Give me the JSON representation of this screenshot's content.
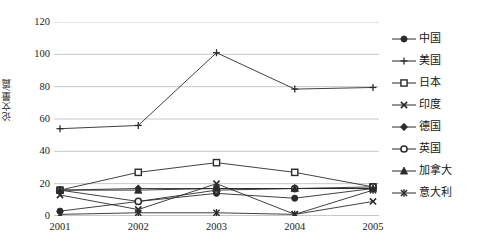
{
  "chart_data": {
    "type": "line",
    "title": "",
    "xlabel": "",
    "ylabel": "论文量/篇",
    "categories": [
      "2001",
      "2002",
      "2003",
      "2004",
      "2005"
    ],
    "x": [
      2001,
      2002,
      2003,
      2004,
      2005
    ],
    "ylim": [
      0,
      120
    ],
    "yticks": [
      0,
      20,
      40,
      60,
      80,
      100,
      120
    ],
    "grid": "horizontal",
    "legend_position": "right",
    "series": [
      {
        "name": "中国",
        "marker": "filled-circle",
        "values": [
          3,
          9,
          14,
          11,
          17
        ]
      },
      {
        "name": "美国",
        "marker": "plus",
        "values": [
          54,
          56,
          101,
          78.5,
          79.5
        ]
      },
      {
        "name": "日本",
        "marker": "open-square",
        "values": [
          16,
          27,
          33,
          27,
          18
        ]
      },
      {
        "name": "印度",
        "marker": "cross",
        "values": [
          13,
          4,
          20,
          1,
          9
        ]
      },
      {
        "name": "德国",
        "marker": "filled-diamond",
        "values": [
          16,
          17,
          17,
          17,
          17
        ]
      },
      {
        "name": "英国",
        "marker": "open-circle",
        "values": [
          16,
          9,
          16,
          17,
          18
        ]
      },
      {
        "name": "加拿大",
        "marker": "filled-triangle",
        "values": [
          16,
          16,
          17,
          17,
          17
        ]
      },
      {
        "name": "意大利",
        "marker": "asterisk",
        "values": [
          1,
          2,
          2,
          1,
          16
        ]
      }
    ]
  },
  "axis": {
    "y_tick_labels": [
      "120",
      "100",
      "80",
      "60",
      "40",
      "20",
      "0"
    ],
    "y_title": "论文量/篇",
    "x_tick_labels": [
      "2001",
      "2002",
      "2003",
      "2004",
      "2005"
    ]
  },
  "legend": {
    "items": [
      {
        "label": "中国",
        "icon": "filled-circle-marker-icon"
      },
      {
        "label": "美国",
        "icon": "plus-marker-icon"
      },
      {
        "label": "日本",
        "icon": "open-square-marker-icon"
      },
      {
        "label": "印度",
        "icon": "cross-marker-icon"
      },
      {
        "label": "德国",
        "icon": "filled-diamond-marker-icon"
      },
      {
        "label": "英国",
        "icon": "open-circle-marker-icon"
      },
      {
        "label": "加拿大",
        "icon": "filled-triangle-marker-icon"
      },
      {
        "label": "意大利",
        "icon": "asterisk-marker-icon"
      }
    ]
  },
  "colors": {
    "series_line": "#2b2b2b",
    "grid": "#c8c8c8",
    "text": "#1a1a1a",
    "background": "#ffffff"
  }
}
